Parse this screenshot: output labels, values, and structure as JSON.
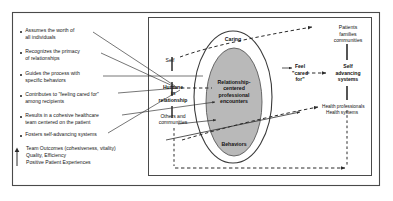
{
  "figure": {
    "colors": {
      "frame": "#4a4a4a",
      "oval_outer_fill": "#ffffff",
      "oval_inner_fill": "#b9b9b9",
      "line": "#2b2b2b",
      "text": "#161616"
    }
  },
  "left_panel": {
    "bullets": [
      {
        "line1": "Assumes the worth of",
        "line2": "all individuals"
      },
      {
        "line1": "Recognizes the primacy",
        "line2": "of relationships"
      },
      {
        "line1": "Guides the process with",
        "line2": "specific behaviors"
      },
      {
        "line1": "Contributes to \"feeling cared for\"",
        "line2": "among recipients"
      },
      {
        "line1": "Results in a cohesive healthcare",
        "line2": "team centered on the patient"
      },
      {
        "line1": "Fosters self-advancing systems",
        "line2": ""
      }
    ],
    "outcomes": {
      "arrow_icon": "up-arrow-icon",
      "lines": [
        "Team Outcomes (cohesiveness, vitality)",
        "Quality, Efficiency",
        "Positive Patient Experiences"
      ]
    }
  },
  "diagram": {
    "oval_outer_label": "Caring",
    "oval_inner_label_l1": "Relationship-",
    "oval_inner_label_l2": "centered",
    "oval_inner_label_l3": "professional",
    "oval_inner_label_l4": "encounters",
    "oval_bottom_label": "Behaviors",
    "axis_labels": [
      {
        "text": "Self",
        "bold": false
      },
      {
        "l1": "Humane",
        "l2": "in",
        "l3": "relationship",
        "bold": true
      },
      {
        "l1": "Others and",
        "l2": "communities",
        "bold": false
      }
    ],
    "right_labels": {
      "feel_cared_for_l1": "Feel",
      "feel_cared_for_l2": "\"cared",
      "feel_cared_for_l3": "for\"",
      "patients_l1": "Patients",
      "patients_l2": "families",
      "patients_l3": "communities",
      "self_adv_l1": "Self",
      "self_adv_l2": "advancing",
      "self_adv_l3": "systems",
      "health_l1": "Health professionals",
      "health_l2": "Health systems"
    }
  }
}
